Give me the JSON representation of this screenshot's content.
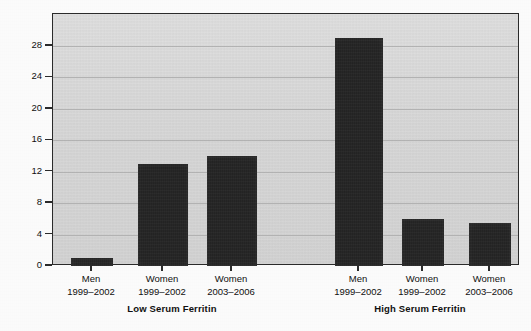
{
  "chart_data": {
    "type": "bar",
    "title": "",
    "subtitle": "",
    "xlabel": "",
    "ylabel": "Prevalence (%)",
    "ylim": [
      0,
      30
    ],
    "yticks": [
      0,
      4,
      8,
      12,
      16,
      20,
      24,
      28
    ],
    "ytick_labels": [
      "0",
      "4",
      "8",
      "12",
      "16",
      "20",
      "24",
      "28"
    ],
    "grid": true,
    "legend": "none",
    "categories": [
      "Men 1999–2002",
      "Women 1999–2002",
      "Women 2003–2006",
      "Men 1999–2002",
      "Women 1999–2002",
      "Women 2003–2006"
    ],
    "values": [
      1,
      13,
      14,
      29,
      6,
      5.5
    ],
    "groups": [
      {
        "label": "Low Serum Ferritin",
        "categories": [
          {
            "sex": "Men",
            "period": "1999–2002",
            "value": 1
          },
          {
            "sex": "Women",
            "period": "1999–2002",
            "value": 13
          },
          {
            "sex": "Women",
            "period": "2003–2006",
            "value": 14
          }
        ]
      },
      {
        "label": "High Serum Ferritin",
        "categories": [
          {
            "sex": "Men",
            "period": "1999–2002",
            "value": 29
          },
          {
            "sex": "Women",
            "period": "1999–2002",
            "value": 6
          },
          {
            "sex": "Women",
            "period": "2003–2006",
            "value": 5.5
          }
        ]
      }
    ],
    "bar_color": "#222222",
    "plot_background": "#d8d8d8",
    "axis_color": "#2b2b2b"
  },
  "axis": {
    "ylabel": "Prevalence (%)",
    "ytick_labels": [
      "28",
      "24",
      "20",
      "16",
      "12",
      "8",
      "4",
      "0"
    ]
  },
  "bars": [
    {
      "sex": "Men",
      "period": "1999–2002",
      "value": 1
    },
    {
      "sex": "Women",
      "period": "1999–2002",
      "value": 13
    },
    {
      "sex": "Women",
      "period": "2003–2006",
      "value": 14
    },
    {
      "sex": "Men",
      "period": "1999–2002",
      "value": 29
    },
    {
      "sex": "Women",
      "period": "1999–2002",
      "value": 6
    },
    {
      "sex": "Women",
      "period": "2003–2006",
      "value": 5.5
    }
  ],
  "groups": [
    {
      "label": "Low Serum Ferritin"
    },
    {
      "label": "High Serum Ferritin"
    }
  ]
}
